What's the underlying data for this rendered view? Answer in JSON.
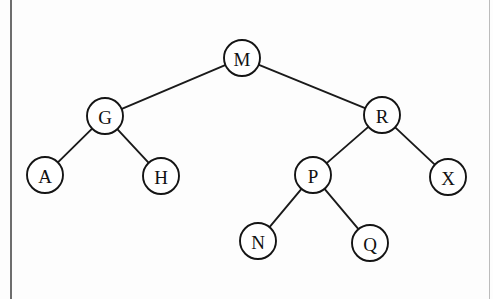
{
  "figure": {
    "kind": "binary-search-tree-diagram",
    "background_color": "#fdfdfd",
    "node_fill_color": "#ffffff",
    "node_stroke_color": "#141414",
    "edge_color": "#1a1a1a",
    "label_color": "#111111",
    "node_radius": 18
  },
  "page_rules": {
    "left": {
      "x": 10,
      "width": 2,
      "color": "#6d6d6d"
    },
    "right": {
      "x": 489,
      "width": 1,
      "color": "#bcbcbc"
    }
  },
  "tree": {
    "root": "M",
    "nodes": [
      {
        "id": "M",
        "label": "M",
        "cx": 242,
        "cy": 58,
        "level": 1
      },
      {
        "id": "G",
        "label": "G",
        "cx": 105,
        "cy": 116,
        "level": 2
      },
      {
        "id": "R",
        "label": "R",
        "cx": 382,
        "cy": 115,
        "level": 2
      },
      {
        "id": "A",
        "label": "A",
        "cx": 45,
        "cy": 175,
        "level": 3
      },
      {
        "id": "H",
        "label": "H",
        "cx": 161,
        "cy": 176,
        "level": 3
      },
      {
        "id": "P",
        "label": "P",
        "cx": 313,
        "cy": 175,
        "level": 3
      },
      {
        "id": "X",
        "label": "X",
        "cx": 448,
        "cy": 177,
        "level": 3
      },
      {
        "id": "N",
        "label": "N",
        "cx": 258,
        "cy": 241,
        "level": 4
      },
      {
        "id": "Q",
        "label": "Q",
        "cx": 370,
        "cy": 243,
        "level": 4
      }
    ],
    "edges": [
      {
        "from": "M",
        "to": "G",
        "side": "left"
      },
      {
        "from": "M",
        "to": "R",
        "side": "right"
      },
      {
        "from": "G",
        "to": "A",
        "side": "left"
      },
      {
        "from": "G",
        "to": "H",
        "side": "right"
      },
      {
        "from": "R",
        "to": "P",
        "side": "left"
      },
      {
        "from": "R",
        "to": "X",
        "side": "right"
      },
      {
        "from": "P",
        "to": "N",
        "side": "left"
      },
      {
        "from": "P",
        "to": "Q",
        "side": "right"
      }
    ]
  }
}
